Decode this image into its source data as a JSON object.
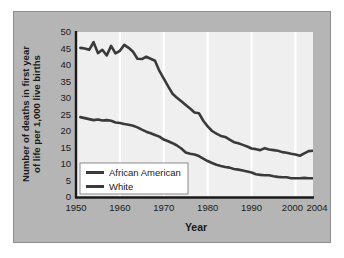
{
  "figure": {
    "panel_bg": "#b5b5b5",
    "plot_bg": "#efefef",
    "gridline_color": "#ffffff",
    "line_color": "#3a3a3a",
    "axis_color": "#1a1a1a"
  },
  "chart_data": {
    "type": "line",
    "title": "",
    "xlabel": "Year",
    "ylabel": "Number of deaths in first year of life per 1,000 live births",
    "ylabel_line1": "Number of deaths in first year",
    "ylabel_line2": "of life per 1,000 live births",
    "xlim": [
      1950,
      2004
    ],
    "ylim": [
      0,
      50
    ],
    "ytick_labels": [
      "0",
      "5",
      "10",
      "15",
      "20",
      "25",
      "30",
      "35",
      "40",
      "45",
      "50"
    ],
    "ytick_values": [
      0,
      5,
      10,
      15,
      20,
      25,
      30,
      35,
      40,
      45,
      50
    ],
    "xtick_labels": [
      "1950",
      "1960",
      "1970",
      "1980",
      "1990",
      "2000",
      "2004"
    ],
    "xtick_values": [
      1950,
      1960,
      1970,
      1980,
      1990,
      2000,
      2004
    ],
    "grid": "vertical",
    "legend_position": "bottom-left",
    "series": [
      {
        "name": "African American",
        "x": [
          1951,
          1952,
          1953,
          1954,
          1955,
          1956,
          1957,
          1958,
          1959,
          1960,
          1961,
          1962,
          1963,
          1964,
          1965,
          1966,
          1967,
          1968,
          1969,
          1970,
          1971,
          1972,
          1973,
          1974,
          1975,
          1976,
          1977,
          1978,
          1979,
          1980,
          1981,
          1982,
          1983,
          1984,
          1985,
          1986,
          1987,
          1988,
          1989,
          1990,
          1991,
          1992,
          1993,
          1994,
          1995,
          1996,
          1997,
          1998,
          1999,
          2000,
          2001,
          2002,
          2003,
          2004
        ],
        "values": [
          45.2,
          45.0,
          44.6,
          46.9,
          43.6,
          44.6,
          42.9,
          45.8,
          43.5,
          44.3,
          46.1,
          45.2,
          44.0,
          41.9,
          41.8,
          42.5,
          41.9,
          41.3,
          38.2,
          35.9,
          33.5,
          31.3,
          30.1,
          29.0,
          27.9,
          26.8,
          25.6,
          25.4,
          23.1,
          21.4,
          20.0,
          19.2,
          18.5,
          18.2,
          17.4,
          16.6,
          16.3,
          15.8,
          15.3,
          14.7,
          14.5,
          14.2,
          14.8,
          14.4,
          14.2,
          14.0,
          13.6,
          13.4,
          13.1,
          12.9,
          12.5,
          13.2,
          13.9,
          14.0
        ]
      },
      {
        "name": "White",
        "x": [
          1951,
          1952,
          1953,
          1954,
          1955,
          1956,
          1957,
          1958,
          1959,
          1960,
          1961,
          1962,
          1963,
          1964,
          1965,
          1966,
          1967,
          1968,
          1969,
          1970,
          1971,
          1972,
          1973,
          1974,
          1975,
          1976,
          1977,
          1978,
          1979,
          1980,
          1981,
          1982,
          1983,
          1984,
          1985,
          1986,
          1987,
          1988,
          1989,
          1990,
          1991,
          1992,
          1993,
          1994,
          1995,
          1996,
          1997,
          1998,
          1999,
          2000,
          2001,
          2002,
          2003,
          2004
        ],
        "values": [
          24.2,
          23.9,
          23.6,
          23.3,
          23.5,
          23.2,
          23.3,
          23.1,
          22.6,
          22.4,
          22.1,
          21.9,
          21.6,
          21.1,
          20.4,
          19.8,
          19.3,
          18.8,
          18.3,
          17.4,
          16.9,
          16.3,
          15.6,
          14.7,
          13.5,
          13.1,
          12.9,
          12.4,
          11.6,
          10.9,
          10.3,
          9.8,
          9.4,
          9.1,
          8.9,
          8.5,
          8.3,
          8.0,
          7.7,
          7.4,
          6.9,
          6.7,
          6.6,
          6.6,
          6.3,
          6.1,
          6.0,
          6.0,
          5.7,
          5.7,
          5.7,
          5.8,
          5.7,
          5.7
        ]
      }
    ]
  },
  "legend": {
    "items": [
      {
        "label": "African American",
        "swatch_color": "#3a3a3a"
      },
      {
        "label": "White",
        "swatch_color": "#3a3a3a"
      }
    ]
  }
}
